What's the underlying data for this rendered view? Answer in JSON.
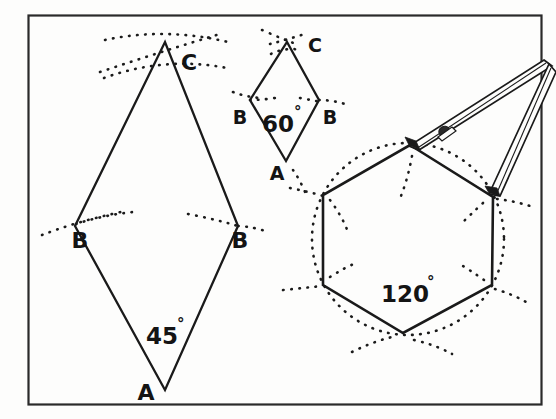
{
  "figure": {
    "name": "geometric-construction-diagram",
    "caption_text": "",
    "background_color": "#fdfdfc",
    "ink_color": "#141414",
    "frame": {
      "name": "border-frame",
      "x": 28,
      "y": 15,
      "width": 514,
      "height": 390,
      "stroke_color": "#222222"
    },
    "shapes": [
      {
        "name": "rhombus-45-degree",
        "kind": "rhombus",
        "angle_label": "45",
        "degree_symbol": "°",
        "vertex_labels": [
          "A",
          "B",
          "C",
          "B"
        ],
        "points": "165,390 75,226 165,42 238,226"
      },
      {
        "name": "rhombus-60-degree",
        "kind": "rhombus",
        "angle_label": "60",
        "degree_symbol": "°",
        "vertex_labels": [
          "A",
          "B",
          "C",
          "B"
        ],
        "points": "286,161 250,100 287,42 319,100"
      },
      {
        "name": "hexagon-120-degree",
        "kind": "hexagon",
        "angle_label": "120",
        "degree_symbol": "°",
        "vertex_labels": [],
        "points": "410,145 493,197 492,285 403,333 323,285 323,195"
      }
    ],
    "labels": {
      "rhombus45": {
        "A": "A",
        "B_left": "B",
        "B_right": "B",
        "C": "C",
        "angle": "45",
        "degree": "°"
      },
      "rhombus60": {
        "A": "A",
        "B_left": "B",
        "B_right": "B",
        "C": "C",
        "angle": "60",
        "degree": "°"
      },
      "hexagon": {
        "angle": "120",
        "degree": "°"
      }
    },
    "instruments": [
      {
        "name": "compass-divider-tool",
        "description_label": ""
      }
    ],
    "construction_marks": {
      "name": "dotted-construction-arcs",
      "style": "dotted",
      "count_visible": 18
    }
  }
}
